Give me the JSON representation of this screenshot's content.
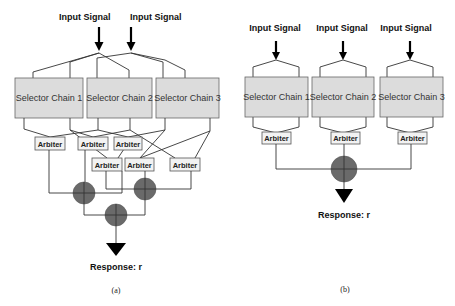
{
  "panel_a": {
    "caption": "(a)",
    "inputs": [
      "Input Signal",
      "Input Signal"
    ],
    "chains": [
      "Selector Chain 1",
      "Selector Chain 2",
      "Selector Chain 3"
    ],
    "arbiters": [
      "Arbiter",
      "Arbiter",
      "Arbiter",
      "Arbiter",
      "Arbiter",
      "Arbiter"
    ],
    "combiner_count": 3,
    "response": "Response: r"
  },
  "panel_b": {
    "caption": "(b)",
    "inputs": [
      "Input Signal",
      "Input Signal",
      "Input Signal"
    ],
    "chains": [
      "Selector Chain 1",
      "Selector Chain 2",
      "Selector Chain 3"
    ],
    "arbiters": [
      "Arbiter",
      "Arbiter",
      "Arbiter"
    ],
    "combiner_count": 1,
    "response": "Response: r"
  },
  "colors": {
    "chain_fill": "#dcdcdc",
    "arbiter_fill": "#f2f2f2",
    "combiner_fill": "#6a6a6a",
    "line": "#333333"
  }
}
